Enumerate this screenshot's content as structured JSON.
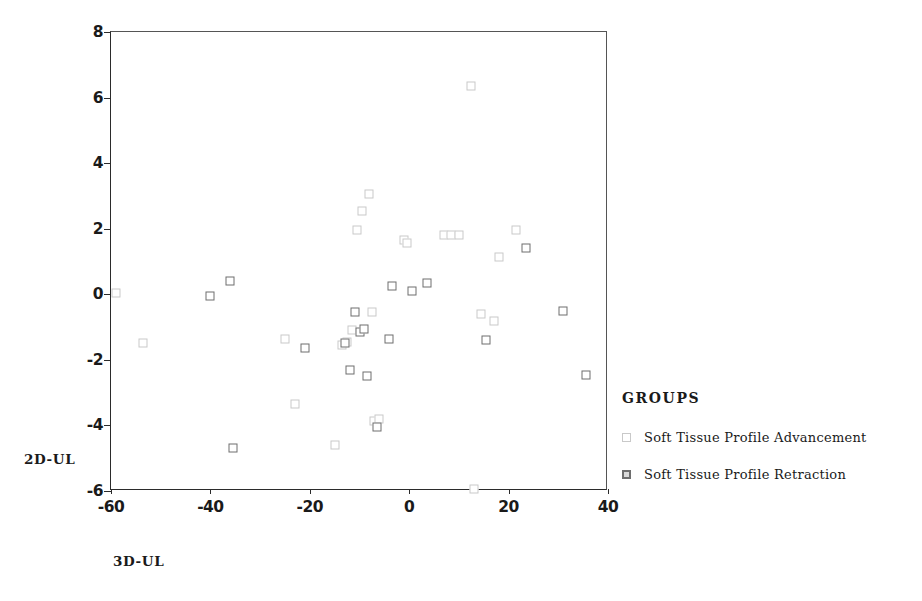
{
  "chart_data": {
    "type": "scatter",
    "title": "",
    "xlabel": "3D-UL",
    "ylabel": "2D-UL",
    "xlim": [
      -60,
      40
    ],
    "ylim": [
      -6,
      8
    ],
    "xticks": [
      -60,
      -40,
      -20,
      0,
      20,
      40
    ],
    "xtick_labels": [
      "-60",
      "-40",
      "-20",
      "0",
      "20",
      "40"
    ],
    "yticks": [
      -6,
      -4,
      -2,
      0,
      2,
      4,
      6,
      8
    ],
    "ytick_labels": [
      "-6",
      "-4",
      "-2",
      "0",
      "2",
      "4",
      "6",
      "8"
    ],
    "grid": false,
    "legend_title": "GROUPS",
    "legend_position": "right",
    "series": [
      {
        "name": "Soft Tissue Profile Advancement",
        "marker": "open-square",
        "color": "#c9c9c9",
        "points": [
          [
            -59.0,
            0.05
          ],
          [
            -53.5,
            -1.5
          ],
          [
            -25.0,
            -1.35
          ],
          [
            -23.0,
            -3.35
          ],
          [
            -15.0,
            -4.6
          ],
          [
            -13.5,
            -1.55
          ],
          [
            -12.5,
            -1.45
          ],
          [
            -11.5,
            -1.1
          ],
          [
            -10.5,
            1.95
          ],
          [
            -9.5,
            2.55
          ],
          [
            -8.0,
            3.05
          ],
          [
            -7.5,
            -0.55
          ],
          [
            -7.0,
            -3.85
          ],
          [
            -6.0,
            -3.8
          ],
          [
            -1.0,
            1.65
          ],
          [
            -0.5,
            1.55
          ],
          [
            7.0,
            1.8
          ],
          [
            8.5,
            1.8
          ],
          [
            10.0,
            1.8
          ],
          [
            12.5,
            6.35
          ],
          [
            13.0,
            -5.95
          ],
          [
            14.5,
            -0.6
          ],
          [
            17.0,
            -0.8
          ],
          [
            18.0,
            1.15
          ],
          [
            21.5,
            1.95
          ]
        ]
      },
      {
        "name": "Soft Tissue Profile Retraction",
        "marker": "filled-square",
        "color": "#6e6e6e",
        "points": [
          [
            -40.0,
            -0.05
          ],
          [
            -36.0,
            0.4
          ],
          [
            -35.5,
            -4.7
          ],
          [
            -21.0,
            -1.65
          ],
          [
            -13.0,
            -1.5
          ],
          [
            -12.0,
            -2.3
          ],
          [
            -11.0,
            -0.55
          ],
          [
            -10.0,
            -1.15
          ],
          [
            -9.0,
            -1.05
          ],
          [
            -8.5,
            -2.5
          ],
          [
            -6.5,
            -4.05
          ],
          [
            -4.0,
            -1.35
          ],
          [
            -3.5,
            0.25
          ],
          [
            0.5,
            0.1
          ],
          [
            3.5,
            0.35
          ],
          [
            15.5,
            -1.4
          ],
          [
            23.5,
            1.4
          ],
          [
            31.0,
            -0.5
          ],
          [
            35.5,
            -2.45
          ]
        ]
      }
    ]
  }
}
